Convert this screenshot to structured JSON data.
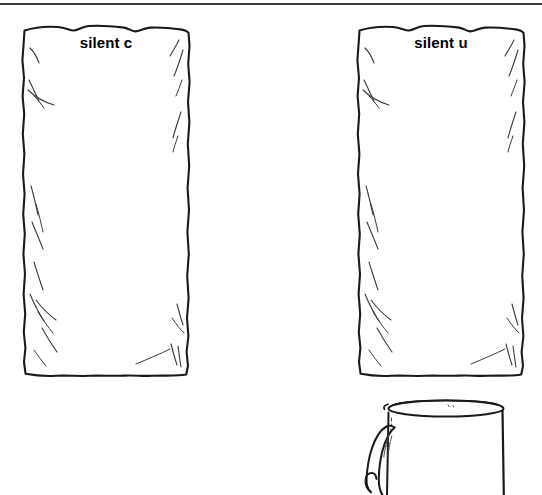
{
  "page": {
    "background_color": "#ffffff",
    "ink_color": "#1a1a1a",
    "rule_color": "#3a3a3a",
    "width": 542,
    "height": 495
  },
  "divider": {
    "name": "top-horizontal-rule",
    "thickness_px": 2
  },
  "notes": [
    {
      "id": "silent-c",
      "label": "silent c",
      "x": 16,
      "y": 18,
      "width": 180,
      "height": 365
    },
    {
      "id": "silent-u",
      "label": "silent u",
      "x": 351,
      "y": 18,
      "width": 180,
      "height": 365
    }
  ],
  "illustration": {
    "name": "beaker-jug",
    "description": "hand-drawn measuring jug with handle, partially cropped at bottom edge",
    "x": 360,
    "y": 396,
    "width": 182,
    "height": 99
  }
}
